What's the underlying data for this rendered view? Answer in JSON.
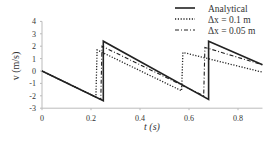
{
  "chart_data": {
    "type": "line",
    "title": "",
    "xlabel": "t (s)",
    "ylabel": "v (m/s)",
    "xlim": [
      0,
      0.9
    ],
    "ylim": [
      -3,
      4
    ],
    "xticks": [
      0,
      0.2,
      0.4,
      0.6,
      0.8
    ],
    "xtick_labels": [
      "0",
      "0.2",
      "0.4",
      "0.6",
      "0.8"
    ],
    "yticks": [
      -3,
      -2,
      -1,
      0,
      1,
      2,
      3,
      4
    ],
    "ytick_labels": [
      "-3",
      "-2",
      "-1",
      "0",
      "1",
      "2",
      "3",
      "4"
    ],
    "grid": false,
    "legend_position": "upper right",
    "series": [
      {
        "name": "Analytical",
        "style": "solid",
        "x": [
          0,
          0.25,
          0.25,
          0.68,
          0.68,
          0.9
        ],
        "y": [
          0,
          -2.4,
          2.4,
          -2.3,
          2.4,
          0.5
        ]
      },
      {
        "name": "Δx = 0.1 m",
        "style": "dotted",
        "x": [
          0,
          0.22,
          0.225,
          0.57,
          0.575,
          0.9
        ],
        "y": [
          0,
          -2.1,
          1.7,
          -1.6,
          1.5,
          -0.1
        ]
      },
      {
        "name": "Δx = 0.05 m",
        "style": "dashdot",
        "x": [
          0,
          0.24,
          0.245,
          0.66,
          0.665,
          0.9
        ],
        "y": [
          0,
          -2.3,
          2.0,
          -2.0,
          1.9,
          0.5
        ]
      }
    ]
  },
  "legend": {
    "items": [
      {
        "label": "Analytical"
      },
      {
        "label": "Δx = 0.1 m"
      },
      {
        "label": "Δx = 0.05 m"
      }
    ]
  },
  "axes": {
    "xlabel": "t (s)",
    "ylabel": "v (m/s)"
  }
}
